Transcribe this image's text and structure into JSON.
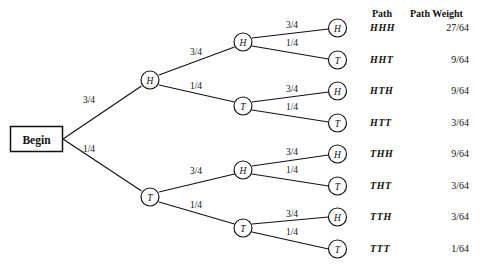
{
  "diagram": {
    "type": "probability-tree",
    "title": "",
    "background_color": "#ffffff",
    "line_color": "#111111",
    "root": {
      "label": "Begin",
      "shape": "rectangle"
    },
    "columns": {
      "path_header": "Path",
      "weight_header": "Path Weight"
    },
    "levels": [
      {
        "level": 1,
        "nodes": [
          {
            "id": "H",
            "label": "H",
            "edge_label": "3/4"
          },
          {
            "id": "T",
            "label": "T",
            "edge_label": "1/4"
          }
        ]
      },
      {
        "level": 2,
        "nodes": [
          {
            "id": "HH",
            "label": "H",
            "edge_label": "3/4"
          },
          {
            "id": "HT",
            "label": "T",
            "edge_label": "1/4"
          },
          {
            "id": "TH",
            "label": "H",
            "edge_label": "3/4"
          },
          {
            "id": "TT",
            "label": "T",
            "edge_label": "1/4"
          }
        ]
      },
      {
        "level": 3,
        "nodes": [
          {
            "id": "HHH",
            "label": "H",
            "edge_label": "3/4"
          },
          {
            "id": "HHT",
            "label": "T",
            "edge_label": "1/4"
          },
          {
            "id": "HTH",
            "label": "H",
            "edge_label": "3/4"
          },
          {
            "id": "HTT",
            "label": "T",
            "edge_label": "1/4"
          },
          {
            "id": "THH",
            "label": "H",
            "edge_label": "3/4"
          },
          {
            "id": "THT",
            "label": "T",
            "edge_label": "1/4"
          },
          {
            "id": "TTH",
            "label": "H",
            "edge_label": "3/4"
          },
          {
            "id": "TTT",
            "label": "T",
            "edge_label": "1/4"
          }
        ]
      }
    ],
    "outcomes": [
      {
        "path": "HHH",
        "weight": "27/64"
      },
      {
        "path": "HHT",
        "weight": "9/64"
      },
      {
        "path": "HTH",
        "weight": "9/64"
      },
      {
        "path": "HTT",
        "weight": "3/64"
      },
      {
        "path": "THH",
        "weight": "9/64"
      },
      {
        "path": "THT",
        "weight": "3/64"
      },
      {
        "path": "TTH",
        "weight": "3/64"
      },
      {
        "path": "TTT",
        "weight": "1/64"
      }
    ]
  }
}
